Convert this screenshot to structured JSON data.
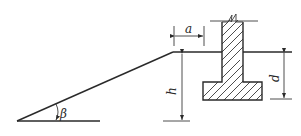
{
  "diagram": {
    "type": "retaining wall foundation cross-section near slope",
    "labels": {
      "a": "a",
      "h": "h",
      "d": "d",
      "beta": "β"
    },
    "elements": [
      {
        "name": "slope",
        "description": "inclined ground line rising from lower left at angle β"
      },
      {
        "name": "wall-stem",
        "description": "hatched vertical wall with break line at top"
      },
      {
        "name": "footing",
        "description": "hatched spread footing under the wall"
      },
      {
        "name": "dim-a",
        "description": "horizontal distance from slope crest to wall face"
      },
      {
        "name": "dim-h",
        "description": "vertical slope height"
      },
      {
        "name": "dim-d",
        "description": "foundation embedment depth"
      }
    ],
    "colors": {
      "line": "#2a2a2a",
      "background": "#ffffff"
    }
  }
}
